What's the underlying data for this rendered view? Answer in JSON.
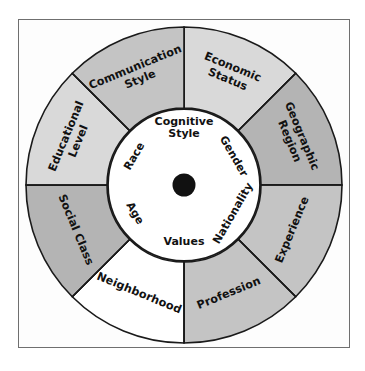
{
  "diagram": {
    "type": "concentric-wheel",
    "center_hub": {
      "name": "hub-dot",
      "color": "#111111"
    },
    "core": {
      "fill": "#ffffff",
      "stroke": "#1a1a1a"
    },
    "frame": {
      "stroke": "#6f6f6f",
      "fill": "#fdfdfd"
    },
    "colors": {
      "light_gray": "#d9d9d9",
      "mid_gray": "#c4c4c4",
      "dark_gray": "#b4b4b4",
      "white": "#ffffff",
      "outline": "#1a1a1a",
      "text": "#111111"
    },
    "inner_ring": {
      "name": "inner-dimensions",
      "items": [
        {
          "label": "Cognitive Style",
          "lines": [
            "Cognitive",
            "Style"
          ],
          "angle_deg": -90
        },
        {
          "label": "Gender",
          "lines": [
            "Gender"
          ],
          "angle_deg": -30
        },
        {
          "label": "Nationality",
          "lines": [
            "Nationality"
          ],
          "angle_deg": 30
        },
        {
          "label": "Values",
          "lines": [
            "Values"
          ],
          "angle_deg": 90
        },
        {
          "label": "Age",
          "lines": [
            "Age"
          ],
          "angle_deg": 150
        },
        {
          "label": "Race",
          "lines": [
            "Race"
          ],
          "angle_deg": -150
        }
      ]
    },
    "outer_ring": {
      "name": "outer-dimensions",
      "items": [
        {
          "label": "Economic Status",
          "lines": [
            "Economic",
            "Status"
          ],
          "fill": "light_gray",
          "start_deg": -90,
          "end_deg": -45
        },
        {
          "label": "Geographic Region",
          "lines": [
            "Geographic",
            "Region"
          ],
          "fill": "dark_gray",
          "start_deg": -45,
          "end_deg": 0
        },
        {
          "label": "Experience",
          "lines": [
            "Experience"
          ],
          "fill": "mid_gray",
          "start_deg": 0,
          "end_deg": 45
        },
        {
          "label": "Profession",
          "lines": [
            "Profession"
          ],
          "fill": "mid_gray",
          "start_deg": 45,
          "end_deg": 90
        },
        {
          "label": "Neighborhood",
          "lines": [
            "Neighborhood"
          ],
          "fill": "white",
          "start_deg": 90,
          "end_deg": 135
        },
        {
          "label": "Social Class",
          "lines": [
            "Social Class"
          ],
          "fill": "dark_gray",
          "start_deg": 135,
          "end_deg": 180
        },
        {
          "label": "Educational Level",
          "lines": [
            "Educational",
            "Level"
          ],
          "fill": "light_gray",
          "start_deg": 180,
          "end_deg": 225
        },
        {
          "label": "Communication Style",
          "lines": [
            "Communication",
            "Style"
          ],
          "fill": "mid_gray",
          "start_deg": 225,
          "end_deg": 270
        }
      ]
    }
  }
}
